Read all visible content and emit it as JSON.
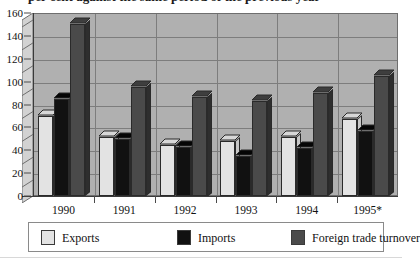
{
  "title": "per cent against the same period of the previous year",
  "chart_data": {
    "type": "bar",
    "title": "",
    "xlabel": "",
    "ylabel": "",
    "ylim": [
      0,
      160
    ],
    "ytick_step": 20,
    "yticks": [
      0,
      20,
      40,
      60,
      80,
      100,
      120,
      140,
      160
    ],
    "grid": true,
    "legend_position": "bottom",
    "categories": [
      "1990",
      "1991",
      "1992",
      "1993",
      "1994",
      "1995*"
    ],
    "series": [
      {
        "name": "Exports",
        "color": "#e3e3e3",
        "values": [
          70,
          52,
          45,
          48,
          52,
          67
        ]
      },
      {
        "name": "Imports",
        "color": "#111111",
        "values": [
          85,
          50,
          43,
          35,
          42,
          57
        ]
      },
      {
        "name": "Foreign trade turnover",
        "color": "#4a4a4a",
        "values": [
          150,
          95,
          87,
          83,
          90,
          105
        ]
      }
    ]
  },
  "legend": {
    "items": [
      {
        "label": "Exports",
        "swatch": "#e3e3e3"
      },
      {
        "label": "Imports",
        "swatch": "#111111"
      },
      {
        "label": "Foreign trade turnover",
        "swatch": "#4a4a4a"
      }
    ]
  },
  "colors": {
    "plot_background": "#b0b0b0",
    "gridline": "#7d7d7d",
    "axis": "#3a3a3a",
    "page_background": "#ffffff"
  }
}
